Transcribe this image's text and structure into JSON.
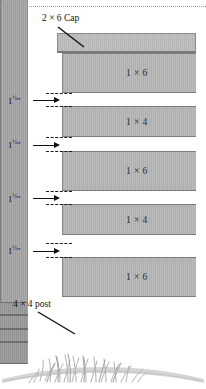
{
  "diagram": {
    "callouts": [
      {
        "id": "cap",
        "label": "2 × 6 Cap"
      },
      {
        "id": "post",
        "label": "4 × 4 post"
      }
    ],
    "boards": [
      {
        "label": "1 × 6"
      },
      {
        "label": "1 × 4"
      },
      {
        "label": "1 × 6"
      },
      {
        "label": "1 × 4"
      },
      {
        "label": "1 × 6"
      }
    ],
    "gap_dimensions": [
      {
        "value": "1",
        "fraction": "½",
        "unit": "\""
      },
      {
        "value": "1",
        "fraction": "½",
        "unit": "\""
      },
      {
        "value": "1",
        "fraction": "½",
        "unit": "\""
      },
      {
        "value": "1",
        "fraction": "½",
        "unit": "\""
      }
    ],
    "colors": {
      "wood_light": "#b7b7b7",
      "wood_cap": "#bdbdbd",
      "wood_post": "#a9a9a9",
      "wood_post_shadow": "#9d9d9d",
      "outline": "#7d7d7d",
      "ink": "#111111",
      "grass": "#b9b9b9",
      "background": "#ffffff"
    }
  }
}
